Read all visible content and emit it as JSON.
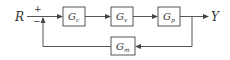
{
  "diagram": {
    "type": "feedback-control-block-diagram",
    "input_label": "R",
    "output_label": "Y",
    "summing_junction": {
      "plus": "+",
      "minus": "−"
    },
    "blocks": [
      {
        "id": "Gc",
        "base": "G",
        "sub": "c"
      },
      {
        "id": "Gv",
        "base": "G",
        "sub": "v"
      },
      {
        "id": "Gp",
        "base": "G",
        "sub": "p"
      },
      {
        "id": "Gm",
        "base": "G",
        "sub": "m"
      }
    ],
    "colors": {
      "stroke": "#444444",
      "text": "#333333",
      "background": "#ffffff"
    }
  }
}
